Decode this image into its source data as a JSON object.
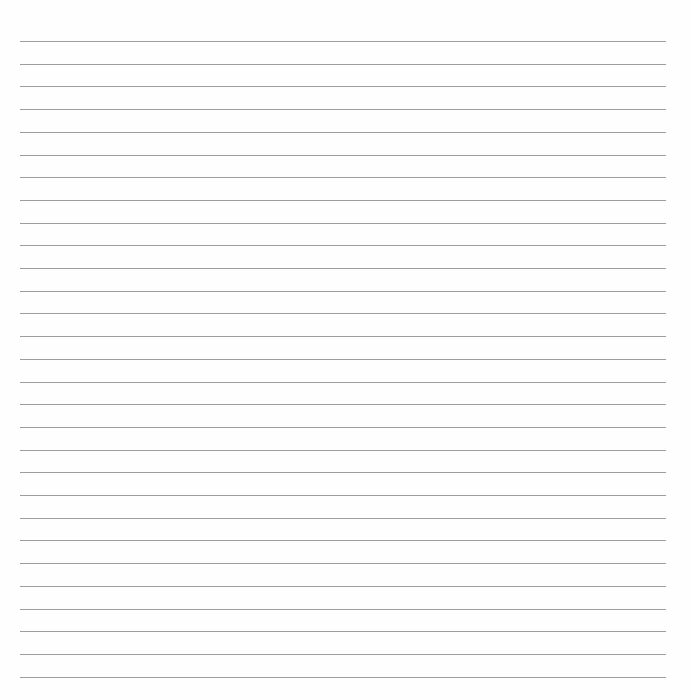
{
  "page": {
    "type": "lined-paper",
    "background_color": "#fefefe",
    "line_color": "#8c8c8c",
    "line_count": 29,
    "first_line_y": 41,
    "line_spacing": 22.7,
    "line_left_x": 20,
    "line_right_x": 666,
    "text": ""
  }
}
